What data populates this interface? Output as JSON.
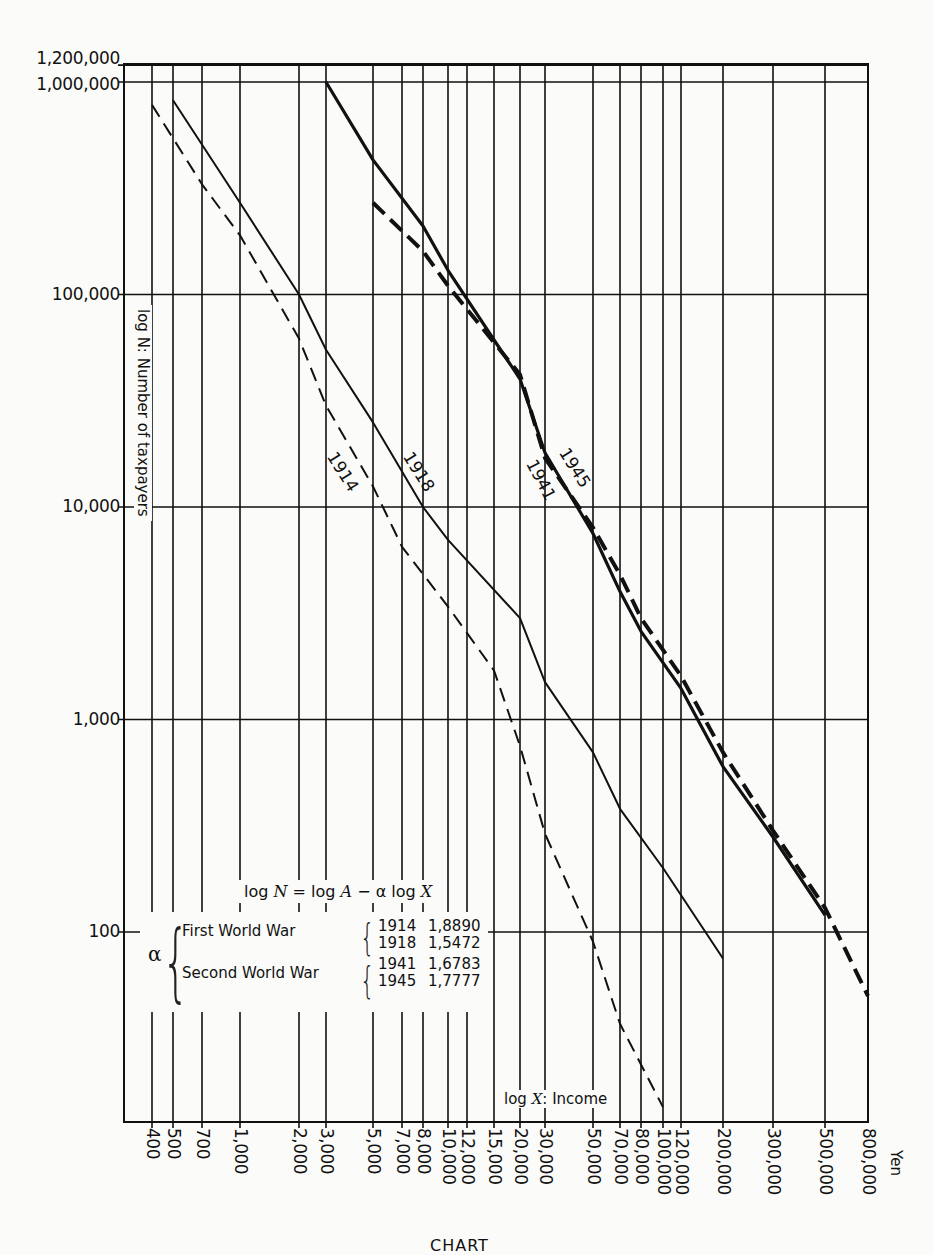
{
  "chart_data": {
    "type": "line",
    "title": "",
    "xlabel": "log X: Income",
    "xunit": "Yen",
    "ylabel": "log N: Number of taxpayers",
    "xscale": "log",
    "yscale": "log",
    "xlim": [
      400,
      800000
    ],
    "ylim": [
      13,
      1200000
    ],
    "grid": true,
    "x_ticks": [
      400,
      500,
      700,
      1000,
      2000,
      3000,
      5000,
      7000,
      8000,
      10000,
      12000,
      15000,
      20000,
      30000,
      50000,
      70000,
      80000,
      100000,
      120000,
      200000,
      300000,
      500000,
      800000
    ],
    "x_tick_labels": [
      "400",
      "500",
      "700",
      "1,000",
      "2,000",
      "3,000",
      "5,000",
      "7,000",
      "8,000",
      "10,000",
      "12,000",
      "15,000",
      "20,000",
      "30,000",
      "50,000",
      "70,000",
      "80,000",
      "100,000",
      "120,000",
      "200,000",
      "300,000",
      "500,000",
      "800,000"
    ],
    "y_ticks": [
      100,
      1000,
      10000,
      100000,
      1000000,
      1200000
    ],
    "y_tick_labels": [
      "100",
      "1,000",
      "10,000",
      "100,000",
      "1,000,000",
      "1,200,000"
    ],
    "series": [
      {
        "name": "1914",
        "style": "dashed-thin",
        "war": "First World War",
        "points": [
          [
            400,
            780000
          ],
          [
            700,
            330000
          ],
          [
            1000,
            190000
          ],
          [
            2000,
            62000
          ],
          [
            3000,
            30000
          ],
          [
            5000,
            12500
          ],
          [
            7000,
            6500
          ],
          [
            10000,
            3400
          ],
          [
            15000,
            1700
          ],
          [
            20000,
            750
          ],
          [
            30000,
            290
          ],
          [
            50000,
            90
          ],
          [
            70000,
            37
          ],
          [
            100000,
            15
          ]
        ]
      },
      {
        "name": "1918",
        "style": "solid-thin",
        "war": "First World War",
        "points": [
          [
            500,
            820000
          ],
          [
            1000,
            270000
          ],
          [
            2000,
            100000
          ],
          [
            3000,
            55000
          ],
          [
            5000,
            25000
          ],
          [
            8000,
            10000
          ],
          [
            10000,
            7000
          ],
          [
            20000,
            3000
          ],
          [
            30000,
            1500
          ],
          [
            50000,
            700
          ],
          [
            70000,
            380
          ],
          [
            100000,
            200
          ],
          [
            200000,
            75
          ]
        ]
      },
      {
        "name": "1941",
        "style": "dashed-thick",
        "war": "Second World War",
        "points": [
          [
            5000,
            270000
          ],
          [
            8000,
            160000
          ],
          [
            10000,
            110000
          ],
          [
            20000,
            42000
          ],
          [
            30000,
            17000
          ],
          [
            50000,
            8000
          ],
          [
            70000,
            4800
          ],
          [
            80000,
            3000
          ],
          [
            120000,
            1600
          ],
          [
            200000,
            700
          ],
          [
            300000,
            300
          ],
          [
            500000,
            130
          ],
          [
            800000,
            50
          ]
        ]
      },
      {
        "name": "1945",
        "style": "solid-thick",
        "war": "Second World War",
        "points": [
          [
            3000,
            1000000
          ],
          [
            5000,
            430000
          ],
          [
            8000,
            210000
          ],
          [
            10000,
            130000
          ],
          [
            20000,
            40000
          ],
          [
            30000,
            18000
          ],
          [
            50000,
            7500
          ],
          [
            70000,
            4000
          ],
          [
            80000,
            2600
          ],
          [
            120000,
            1400
          ],
          [
            200000,
            600
          ],
          [
            300000,
            280
          ],
          [
            500000,
            120
          ]
        ]
      }
    ],
    "annotations": {
      "formula": "log N = log A − α log X",
      "alpha_table": [
        {
          "group": "First World War",
          "year": "1914",
          "alpha": "1,8890"
        },
        {
          "group": "First World War",
          "year": "1918",
          "alpha": "1,5472"
        },
        {
          "group": "Second World War",
          "year": "1941",
          "alpha": "1,6783"
        },
        {
          "group": "Second World War",
          "year": "1945",
          "alpha": "1,7777"
        }
      ]
    }
  },
  "labels": {
    "y_axis_title": "log N: Number of taxpayers",
    "x_axis_title": "log X: Income",
    "x_unit": "Yen",
    "formula_pre": "log ",
    "formula_N": "N",
    "formula_mid": " = log ",
    "formula_A": "A",
    "formula_post": " − α log ",
    "formula_X": "X",
    "alpha_symbol": "α",
    "first_war": "First World War",
    "second_war": "Second World War",
    "years": [
      "1914",
      "1918",
      "1941",
      "1945"
    ],
    "alphas": [
      "1,8890",
      "1,5472",
      "1,6783",
      "1,7777"
    ],
    "caption": "CHART"
  }
}
